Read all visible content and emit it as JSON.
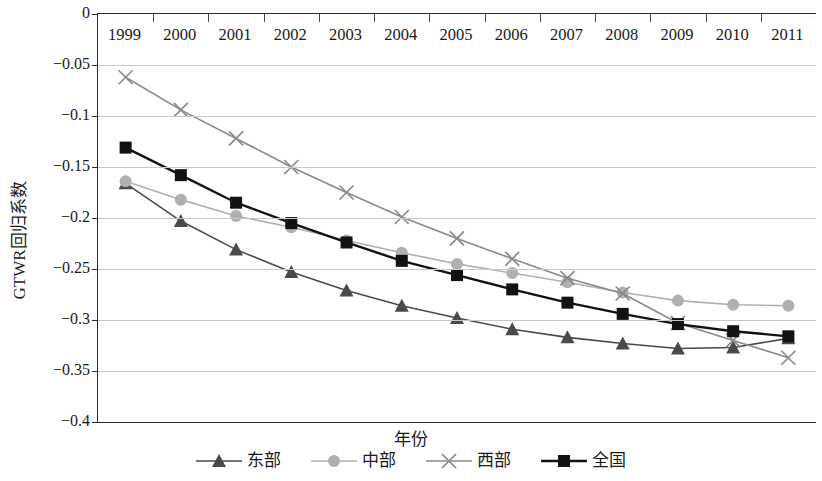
{
  "chart_data": {
    "type": "line",
    "title": "",
    "xlabel": "年份",
    "ylabel": "GTWR回归系数",
    "categories": [
      "1999",
      "2000",
      "2001",
      "2002",
      "2003",
      "2004",
      "2005",
      "2006",
      "2007",
      "2008",
      "2009",
      "2010",
      "2011"
    ],
    "x": [
      1999,
      2000,
      2001,
      2002,
      2003,
      2004,
      2005,
      2006,
      2007,
      2008,
      2009,
      2010,
      2011
    ],
    "ylim": [
      -0.4,
      0
    ],
    "yticks": [
      "0",
      "−0.05",
      "−0.1",
      "−0.15",
      "−0.2",
      "−0.25",
      "−0.3",
      "−0.35",
      "−0.4"
    ],
    "ytick_values": [
      0,
      -0.05,
      -0.1,
      -0.15,
      -0.2,
      -0.25,
      -0.3,
      -0.35,
      -0.4
    ],
    "grid": true,
    "legend_position": "bottom",
    "series": [
      {
        "name": "东部",
        "marker": "triangle",
        "color": "#4a4a4a",
        "values": [
          -0.166,
          -0.203,
          -0.231,
          -0.253,
          -0.271,
          -0.286,
          -0.298,
          -0.309,
          -0.317,
          -0.323,
          -0.328,
          -0.327,
          -0.318
        ]
      },
      {
        "name": "中部",
        "marker": "circle",
        "color": "#b0b0b0",
        "values": [
          -0.164,
          -0.182,
          -0.198,
          -0.209,
          -0.222,
          -0.234,
          -0.245,
          -0.254,
          -0.263,
          -0.273,
          -0.281,
          -0.285,
          -0.286
        ]
      },
      {
        "name": "西部",
        "marker": "cross",
        "color": "#8a8a8a",
        "values": [
          -0.062,
          -0.094,
          -0.122,
          -0.15,
          -0.175,
          -0.199,
          -0.22,
          -0.24,
          -0.259,
          -0.274,
          -0.303,
          -0.32,
          -0.337
        ]
      },
      {
        "name": "全国",
        "marker": "square",
        "color": "#121212",
        "values": [
          -0.131,
          -0.158,
          -0.185,
          -0.205,
          -0.224,
          -0.242,
          -0.256,
          -0.27,
          -0.283,
          -0.294,
          -0.304,
          -0.311,
          -0.316
        ]
      }
    ]
  }
}
